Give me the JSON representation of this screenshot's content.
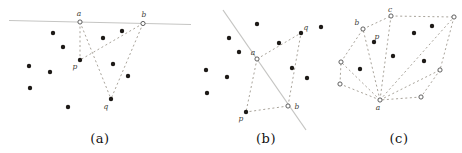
{
  "colors": {
    "background": "#ffffff",
    "solid_line": "#c5c5c3",
    "dashed_line": "#9e988e",
    "filled_point": "#1d1a17",
    "open_point_stroke": "#4f4f4f",
    "open_point_fill": "#ffffff",
    "vertex_label": "#403c36",
    "caption": "#111111"
  },
  "figures": [
    {
      "id": "a",
      "caption": "(a)",
      "caption_x": 100,
      "caption_y": 131,
      "solid_lines": [
        [
          9,
          20.5,
          191,
          24.5
        ]
      ],
      "vertices": {
        "a": {
          "x": 80,
          "y": 22,
          "type": "open",
          "label": "a",
          "lx": 79,
          "ly": 16
        },
        "b": {
          "x": 143,
          "y": 23.5,
          "type": "open",
          "label": "b",
          "lx": 144,
          "ly": 17
        },
        "p": {
          "x": 80,
          "y": 60,
          "type": "filled",
          "label": "p",
          "lx": 75,
          "ly": 69
        },
        "q": {
          "x": 111,
          "y": 99,
          "type": "filled",
          "label": "q",
          "lx": 106,
          "ly": 109
        }
      },
      "edges": [
        [
          "a",
          "p"
        ],
        [
          "a",
          "q"
        ],
        [
          "b",
          "p"
        ],
        [
          "b",
          "q"
        ]
      ],
      "dots": [
        [
          53,
          33
        ],
        [
          103,
          38
        ],
        [
          122,
          31
        ],
        [
          63,
          47
        ],
        [
          29,
          66
        ],
        [
          50,
          72
        ],
        [
          113,
          64
        ],
        [
          128,
          76
        ],
        [
          30,
          88
        ],
        [
          68,
          107
        ]
      ]
    },
    {
      "id": "b",
      "caption": "(b)",
      "caption_x": 266,
      "caption_y": 131,
      "solid_lines": [
        [
          223,
          10,
          306,
          130
        ]
      ],
      "vertices": {
        "a": {
          "x": 257,
          "y": 59,
          "type": "open",
          "label": "a",
          "lx": 253,
          "ly": 55
        },
        "b": {
          "x": 288,
          "y": 106,
          "type": "open",
          "label": "b",
          "lx": 297,
          "ly": 109
        },
        "p": {
          "x": 246,
          "y": 112,
          "type": "filled",
          "label": "p",
          "lx": 241,
          "ly": 121
        },
        "q": {
          "x": 301,
          "y": 33,
          "type": "filled",
          "label": "q",
          "lx": 306,
          "ly": 30
        }
      },
      "edges": [
        [
          "a",
          "p"
        ],
        [
          "a",
          "q"
        ],
        [
          "b",
          "p"
        ],
        [
          "b",
          "q"
        ]
      ],
      "dots": [
        [
          257,
          24
        ],
        [
          229,
          38
        ],
        [
          279,
          43
        ],
        [
          239,
          52
        ],
        [
          206,
          70
        ],
        [
          227,
          77
        ],
        [
          292,
          68
        ],
        [
          307,
          78
        ],
        [
          207,
          93
        ],
        [
          321,
          27
        ]
      ]
    },
    {
      "id": "c",
      "caption": "(c)",
      "caption_x": 399,
      "caption_y": 131,
      "solid_lines": [],
      "vertices": {
        "a": {
          "x": 380,
          "y": 100,
          "type": "open",
          "label": "a",
          "lx": 378,
          "ly": 110
        },
        "b": {
          "x": 363,
          "y": 29,
          "type": "open",
          "label": "b",
          "lx": 357,
          "ly": 25
        },
        "c": {
          "x": 391,
          "y": 16,
          "type": "open",
          "label": "c",
          "lx": 390,
          "ly": 12
        },
        "tr": {
          "x": 454,
          "y": 17,
          "type": "open"
        },
        "r": {
          "x": 440,
          "y": 70,
          "type": "open"
        },
        "lr": {
          "x": 421,
          "y": 97,
          "type": "open"
        },
        "ll": {
          "x": 340,
          "y": 84,
          "type": "open"
        },
        "l": {
          "x": 341,
          "y": 62,
          "type": "open"
        },
        "p": {
          "x": 374,
          "y": 42,
          "type": "filled",
          "label": "p",
          "lx": 377,
          "ly": 39
        }
      },
      "edges": [
        [
          "l",
          "b"
        ],
        [
          "b",
          "c"
        ],
        [
          "c",
          "tr"
        ],
        [
          "tr",
          "r"
        ],
        [
          "r",
          "lr"
        ],
        [
          "lr",
          "a"
        ],
        [
          "a",
          "ll"
        ],
        [
          "ll",
          "l"
        ],
        [
          "a",
          "l"
        ],
        [
          "a",
          "b"
        ],
        [
          "a",
          "c"
        ],
        [
          "a",
          "tr"
        ],
        [
          "a",
          "r"
        ]
      ],
      "dots": [
        [
          414,
          33
        ],
        [
          432,
          26
        ],
        [
          393,
          56
        ],
        [
          424,
          61
        ],
        [
          360,
          69
        ]
      ]
    }
  ]
}
